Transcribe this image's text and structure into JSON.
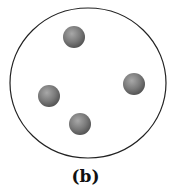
{
  "figure": {
    "label": "(b)",
    "container": {
      "cx": 88,
      "cy": 83,
      "rx": 78,
      "ry": 75,
      "stroke": "#222222"
    },
    "particles": [
      {
        "cx": 74,
        "cy": 37,
        "r": 11
      },
      {
        "cx": 134,
        "cy": 84,
        "r": 11
      },
      {
        "cx": 49,
        "cy": 96,
        "r": 11
      },
      {
        "cx": 80,
        "cy": 124,
        "r": 11
      }
    ],
    "particle_color": "#7a7a7a"
  }
}
